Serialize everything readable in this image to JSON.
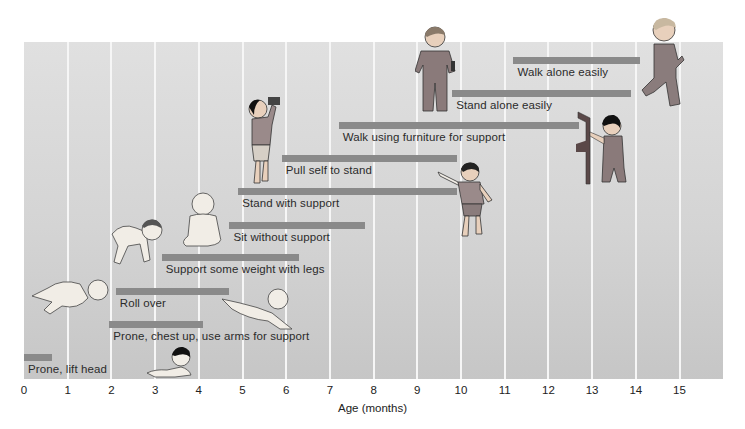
{
  "chart_data": {
    "type": "bar",
    "subtype": "horizontal-range (Gantt-style milestone ranges)",
    "title": "",
    "xlabel": "Age (months)",
    "ylabel": "",
    "xlim": [
      0,
      16
    ],
    "xticks": [
      "0",
      "1",
      "2",
      "3",
      "4",
      "5",
      "6",
      "7",
      "8",
      "9",
      "10",
      "11",
      "12",
      "13",
      "14",
      "15"
    ],
    "grid": true,
    "legend": null,
    "bar_color": "#8a8a8a",
    "background_color": "#d6d6d6",
    "milestones": [
      {
        "label": "Prone, lift head",
        "start": 0.0,
        "end": 0.65
      },
      {
        "label": "Prone, chest up, use arms for support",
        "start": 1.95,
        "end": 4.1
      },
      {
        "label": "Roll over",
        "start": 2.1,
        "end": 4.7
      },
      {
        "label": "Support some weight with legs",
        "start": 3.15,
        "end": 6.3
      },
      {
        "label": "Sit without support",
        "start": 4.7,
        "end": 7.8
      },
      {
        "label": "Stand with support",
        "start": 4.9,
        "end": 9.9
      },
      {
        "label": "Pull self to stand",
        "start": 5.9,
        "end": 9.9
      },
      {
        "label": "Walk using furniture for support",
        "start": 7.2,
        "end": 12.7
      },
      {
        "label": "Stand alone easily",
        "start": 9.8,
        "end": 13.9
      },
      {
        "label": "Walk alone easily",
        "start": 11.2,
        "end": 14.1
      }
    ],
    "illustrations": [
      "baby-lying-prone-lifting-head",
      "baby-prone-chest-up",
      "baby-rolling-over",
      "baby-crawling-position",
      "baby-sitting",
      "toddler-standing-holding-object",
      "toddler-pointing",
      "toddler-walking-with-furniture",
      "toddler-standing-in-overalls",
      "toddler-walking"
    ]
  }
}
